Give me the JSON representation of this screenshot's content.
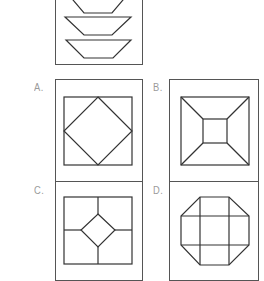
{
  "question": {
    "description": "Stacked trapezoids viewed from the side",
    "shape_count_visible": 3
  },
  "options": [
    {
      "id": "A",
      "label": "A.",
      "description": "Square with inscribed diamond touching midpoints"
    },
    {
      "id": "B",
      "label": "B.",
      "description": "Square frustum top view: outer square, inner square, diagonal corner lines"
    },
    {
      "id": "C",
      "label": "C.",
      "description": "Square divided by cross lines with central diamond"
    },
    {
      "id": "D",
      "label": "D.",
      "description": "Octagon divided into 3x3 grid"
    }
  ],
  "colors": {
    "stroke": "#333333",
    "border": "#555555",
    "label": "#9a9a9a",
    "background": "#ffffff"
  }
}
